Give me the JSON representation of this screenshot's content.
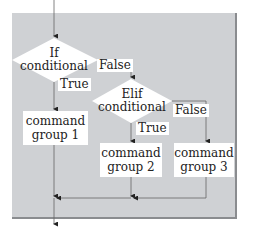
{
  "diagram": {
    "type": "flowchart",
    "title": "",
    "colors": {
      "panel": "#cfd1d4",
      "shape_fill": "#ffffff",
      "line": "#555555"
    },
    "decisions": [
      {
        "id": "if",
        "line1": "If",
        "line2": "conditional"
      },
      {
        "id": "elif",
        "line1": "Elif",
        "line2": "conditional"
      }
    ],
    "processes": [
      {
        "id": "group1",
        "line1": "command",
        "line2": "group 1"
      },
      {
        "id": "group2",
        "line1": "command",
        "line2": "group 2"
      },
      {
        "id": "group3",
        "line1": "command",
        "line2": "group 3"
      }
    ],
    "edge_labels": {
      "if_true": "True",
      "if_false": "False",
      "elif_true": "True",
      "elif_false": "False"
    },
    "edges": [
      {
        "from": "start",
        "to": "if"
      },
      {
        "from": "if",
        "to": "group1",
        "label": "True"
      },
      {
        "from": "if",
        "to": "elif",
        "label": "False"
      },
      {
        "from": "elif",
        "to": "group2",
        "label": "True"
      },
      {
        "from": "elif",
        "to": "group3",
        "label": "False"
      },
      {
        "from": "group1",
        "to": "end"
      },
      {
        "from": "group2",
        "to": "end"
      },
      {
        "from": "group3",
        "to": "end"
      }
    ]
  }
}
